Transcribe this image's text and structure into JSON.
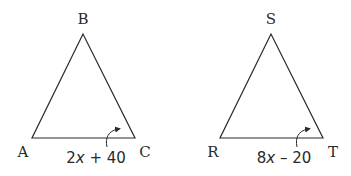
{
  "triangles": [
    {
      "vertices": {
        "apex": "B",
        "left": "A",
        "right": "C"
      },
      "angle_label": {
        "coef": "2",
        "var": "x",
        "rest": " + 40"
      },
      "angle_at": "C"
    },
    {
      "vertices": {
        "apex": "S",
        "left": "R",
        "right": "T"
      },
      "angle_label": {
        "coef": "8",
        "var": "x",
        "rest": " – 20"
      },
      "angle_at": "T"
    }
  ],
  "colors": {
    "stroke": "#2a2a2a",
    "background": "#ffffff"
  }
}
